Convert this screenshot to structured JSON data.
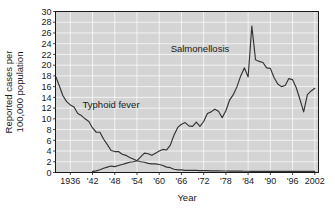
{
  "chart_data": {
    "type": "line",
    "title": "",
    "xlabel": "Year",
    "ylabel": "Reported cases per 100,000 population",
    "ylabel_line1": "Reported cases per",
    "ylabel_line2": "100,000 population",
    "xlim": [
      1932,
      2003
    ],
    "ylim": [
      0,
      30
    ],
    "ytick_step": 2,
    "grid": true,
    "grid_color": "#ffffff",
    "plot_background": "#d4d4d4",
    "line_color": "#333333",
    "axis_color": "#1a1a1a",
    "legend_position": "inline-annotations",
    "xticks": [
      1936,
      1942,
      1948,
      1954,
      1960,
      1966,
      1972,
      1978,
      1984,
      1990,
      1996,
      2002
    ],
    "xtick_labels": [
      "1936",
      "'42",
      "'48",
      "'54",
      "'60",
      "'66",
      "'72",
      "'78",
      "'84",
      "'90",
      "'96",
      "2002"
    ],
    "yticks": [
      0,
      2,
      4,
      6,
      8,
      10,
      12,
      14,
      16,
      18,
      20,
      22,
      24,
      26,
      28,
      30
    ],
    "ytick_labels": [
      "0",
      "2",
      "4",
      "6",
      "8",
      "10",
      "12",
      "14",
      "16",
      "18",
      "20",
      "22",
      "24",
      "26",
      "28",
      "30"
    ],
    "annotations": [
      {
        "text": "Salmonellosis",
        "x": 1971,
        "y": 22.5
      },
      {
        "text": "Typhoid fever",
        "x": 1947,
        "y": 12.0
      }
    ],
    "series": [
      {
        "name": "Typhoid fever",
        "x": [
          1932,
          1933,
          1934,
          1935,
          1936,
          1937,
          1938,
          1939,
          1940,
          1941,
          1942,
          1943,
          1944,
          1945,
          1946,
          1947,
          1948,
          1949,
          1950,
          1951,
          1952,
          1953,
          1954,
          1955,
          1956,
          1957,
          1958,
          1959,
          1960,
          1961,
          1962,
          1963,
          1964,
          1965,
          1966,
          1967,
          1968,
          1969,
          1970,
          1971,
          1972,
          1973,
          1974,
          1975,
          1976,
          1977,
          1978,
          1979,
          1980,
          1981,
          1982,
          1983,
          1984,
          1985,
          1986,
          1987,
          1988,
          1989,
          1990,
          1991,
          1992,
          1993,
          1994,
          1995,
          1996,
          1997,
          1998,
          1999,
          2000,
          2001,
          2002
        ],
        "values": [
          18.0,
          16.2,
          14.3,
          13.2,
          12.6,
          12.2,
          11.0,
          10.6,
          10.0,
          9.5,
          8.3,
          7.5,
          7.5,
          6.2,
          5.2,
          4.1,
          3.9,
          3.9,
          3.4,
          3.2,
          2.8,
          2.5,
          2.2,
          2.0,
          1.9,
          1.7,
          1.6,
          1.6,
          1.5,
          1.3,
          1.0,
          0.9,
          0.6,
          0.5,
          0.5,
          0.4,
          0.4,
          0.4,
          0.4,
          0.35,
          0.35,
          0.35,
          0.3,
          0.3,
          0.3,
          0.28,
          0.27,
          0.26,
          0.25,
          0.25,
          0.25,
          0.24,
          0.23,
          0.22,
          0.22,
          0.22,
          0.21,
          0.21,
          0.2,
          0.2,
          0.2,
          0.2,
          0.2,
          0.2,
          0.2,
          0.2,
          0.2,
          0.2,
          0.2,
          0.2,
          0.2
        ]
      },
      {
        "name": "Salmonellosis",
        "x": [
          1942,
          1943,
          1944,
          1945,
          1946,
          1947,
          1948,
          1949,
          1950,
          1951,
          1952,
          1953,
          1954,
          1955,
          1956,
          1957,
          1958,
          1959,
          1960,
          1961,
          1962,
          1963,
          1964,
          1965,
          1966,
          1967,
          1968,
          1969,
          1970,
          1971,
          1972,
          1973,
          1974,
          1975,
          1976,
          1977,
          1978,
          1979,
          1980,
          1981,
          1982,
          1983,
          1984,
          1985,
          1986,
          1987,
          1988,
          1989,
          1990,
          1991,
          1992,
          1993,
          1994,
          1995,
          1996,
          1997,
          1998,
          1999,
          2000,
          2001,
          2002
        ],
        "values": [
          0.2,
          0.3,
          0.5,
          0.8,
          1.0,
          1.2,
          1.1,
          1.3,
          1.5,
          1.7,
          1.9,
          2.0,
          2.2,
          2.9,
          3.6,
          3.5,
          3.2,
          3.6,
          4.0,
          4.3,
          4.2,
          5.1,
          7.0,
          8.4,
          9.0,
          9.3,
          8.7,
          8.6,
          9.4,
          8.6,
          9.5,
          11.0,
          11.3,
          11.8,
          11.4,
          10.2,
          11.5,
          13.5,
          14.5,
          16.0,
          18.0,
          19.5,
          17.8,
          27.3,
          21.0,
          20.7,
          20.5,
          19.5,
          19.4,
          17.7,
          16.5,
          16.0,
          16.2,
          17.5,
          17.3,
          15.8,
          13.6,
          11.3,
          14.5,
          15.2,
          15.7
        ]
      }
    ]
  },
  "axis": {
    "xlabel": "Year",
    "ylabel_line1": "Reported cases per",
    "ylabel_line2": "100,000 population"
  }
}
